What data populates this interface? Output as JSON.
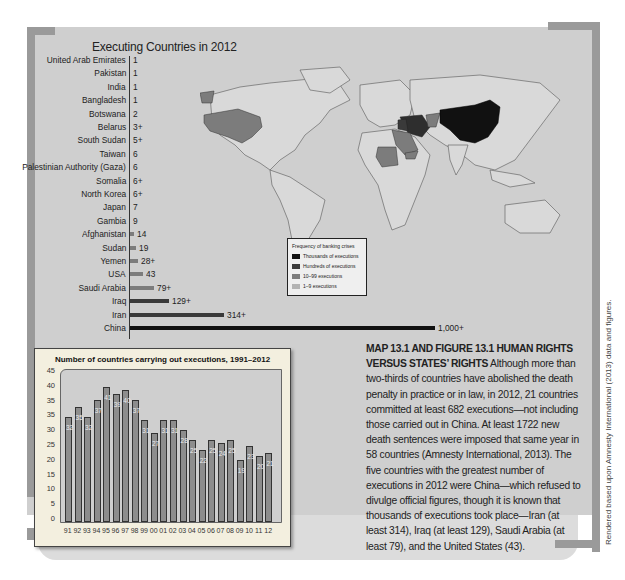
{
  "figure": {
    "map_title": "Executing Countries in 2012",
    "legend": {
      "title": "Frequency of banking crises",
      "items": [
        {
          "label": "Thousands of executions",
          "color": "#111111"
        },
        {
          "label": "Hundreds of executions",
          "color": "#3a3a3a"
        },
        {
          "label": "10–99 executions",
          "color": "#7c7c7c"
        },
        {
          "label": "1–9 executions",
          "color": "#b3b3b3"
        }
      ]
    },
    "caption": {
      "heading": "MAP 13.1 AND FIGURE 13.1    HUMAN RIGHTS VERSUS STATES’ RIGHTS",
      "body": "Although more than two-thirds of countries have abolished the death penalty in practice or in law, in 2012, 21 countries committed at least 682 executions—not including those carried out in China. At least 1722 new death sentences were imposed that same year in 58 countries (Amnesty International, 2013). The five countries with the greatest number of executions in 2012 were China—which refused to divulge official figures, though it is known that thousands of executions took place—Iran (at least 314), Iraq (at least 129), Saudi Arabia (at least  79), and the United States (43)."
    },
    "credit": "Rendered based upon Amnesty International (2013) data and figures."
  },
  "chart_data": [
    {
      "type": "bar",
      "orientation": "horizontal",
      "title": "Executing Countries in 2012",
      "categories": [
        "United Arab Emirates",
        "Pakistan",
        "India",
        "Bangladesh",
        "Botswana",
        "Belarus",
        "South Sudan",
        "Taiwan",
        "Palestinian Authority (Gaza)",
        "Somalia",
        "North Korea",
        "Japan",
        "Gambia",
        "Afghanistan",
        "Sudan",
        "Yemen",
        "USA",
        "Saudi Arabia",
        "Iraq",
        "Iran",
        "China"
      ],
      "values": [
        1,
        1,
        1,
        1,
        2,
        3,
        5,
        6,
        6,
        6,
        6,
        7,
        9,
        14,
        19,
        28,
        43,
        79,
        129,
        314,
        1000
      ],
      "value_labels": [
        "1",
        "1",
        "1",
        "1",
        "2",
        "3+",
        "5+",
        "6",
        "6",
        "6+",
        "6+",
        "7",
        "9",
        "14",
        "19",
        "28+",
        "43",
        "79+",
        "129+",
        "314+",
        "1,000+"
      ],
      "bar_colors": [
        "#b3b3b3",
        "#b3b3b3",
        "#b3b3b3",
        "#b3b3b3",
        "#b3b3b3",
        "#b3b3b3",
        "#b3b3b3",
        "#b3b3b3",
        "#b3b3b3",
        "#b3b3b3",
        "#b3b3b3",
        "#b3b3b3",
        "#b3b3b3",
        "#7c7c7c",
        "#7c7c7c",
        "#7c7c7c",
        "#7c7c7c",
        "#7c7c7c",
        "#3a3a3a",
        "#3a3a3a",
        "#111111"
      ],
      "xlabel": "",
      "ylabel": "",
      "grid": false
    },
    {
      "type": "bar",
      "title": "Number of countries carrying out executions, 1991–2012",
      "categories": [
        "91",
        "92",
        "93",
        "94",
        "95",
        "96",
        "97",
        "98",
        "99",
        "00",
        "01",
        "02",
        "03",
        "04",
        "05",
        "06",
        "07",
        "08",
        "09",
        "10",
        "11",
        "12"
      ],
      "values": [
        32,
        35,
        32,
        37,
        41,
        39,
        40,
        37,
        31,
        27,
        31,
        31,
        28,
        25,
        22,
        25,
        24,
        25,
        19,
        23,
        20,
        21
      ],
      "y_tick_labels": [
        "0",
        "5",
        "10",
        "15",
        "20",
        "25",
        "30",
        "35",
        "35",
        "40",
        "45"
      ],
      "ylim": [
        0,
        45
      ],
      "xlabel": "",
      "ylabel": "",
      "grid": false,
      "legend": null
    }
  ]
}
